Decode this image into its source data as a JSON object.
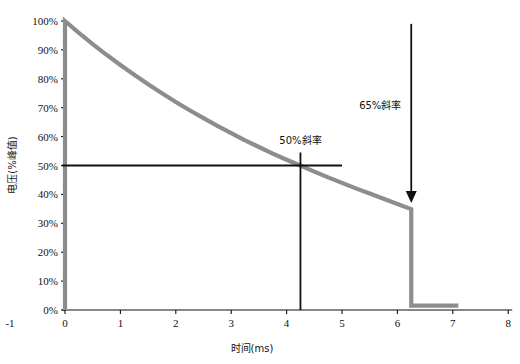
{
  "chart_data": {
    "type": "line",
    "title": "",
    "xlabel": "时间(ms)",
    "ylabel": "电压(%峰值)",
    "xlim": [
      -1,
      8
    ],
    "ylim": [
      0,
      100
    ],
    "grid": false,
    "legend": "none",
    "x_ticks": [
      "0",
      "1",
      "2",
      "3",
      "4",
      "5",
      "6",
      "7",
      "8"
    ],
    "x_tick_values": [
      0,
      1,
      2,
      3,
      4,
      5,
      6,
      7,
      8
    ],
    "y_ticks": [
      "0%",
      "10%",
      "20%",
      "30%",
      "40%",
      "50%",
      "60%",
      "70%",
      "80%",
      "90%",
      "100%"
    ],
    "y_tick_values": [
      0,
      10,
      20,
      30,
      40,
      50,
      60,
      70,
      80,
      90,
      100
    ],
    "extra_axis_label": "-1",
    "series": [
      {
        "name": "voltage-decay",
        "color": "#8d8d8d",
        "x": [
          0.0,
          0.0,
          0.25,
          0.5,
          0.75,
          1.0,
          1.25,
          1.5,
          1.75,
          2.0,
          2.25,
          2.5,
          2.75,
          3.0,
          3.25,
          3.5,
          3.75,
          4.0,
          4.25,
          4.5,
          4.75,
          5.0,
          5.25,
          5.5,
          5.75,
          6.0,
          6.25,
          6.25,
          7.1
        ],
        "values": [
          0.0,
          100.0,
          95.9,
          92.0,
          88.3,
          84.8,
          81.4,
          78.1,
          75.0,
          72.0,
          69.1,
          66.4,
          63.7,
          61.2,
          58.7,
          56.4,
          54.1,
          52.0,
          50.0,
          47.9,
          45.9,
          44.0,
          42.1,
          40.3,
          38.5,
          36.7,
          34.9,
          1.5,
          1.5
        ]
      }
    ],
    "annotations": [
      {
        "name": "50-percent-slope",
        "label": "50%斜率",
        "x": 4.25,
        "y": 50,
        "label_x": 4.25,
        "label_y": 57.5,
        "marker_h_x0": -0.05,
        "marker_h_x1": 5.0,
        "marker_v_y0": 0,
        "marker_v_y1": 54.5,
        "color": "#111111"
      },
      {
        "name": "65-percent-slope",
        "label": "65%斜率",
        "x": 6.25,
        "y": 35,
        "label_x": 6.25,
        "label_y": 69.5,
        "arrow_y_top": 99.0,
        "arrow_y_bottom": 37.0,
        "color": "#111111"
      }
    ]
  },
  "axes": {
    "axis_color": "#111111",
    "tick_color": "#111111"
  }
}
